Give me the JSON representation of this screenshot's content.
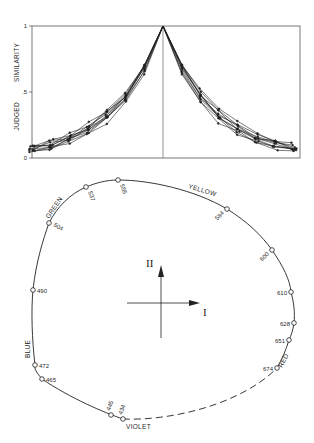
{
  "top_chart": {
    "ylabel_1": "JUDGED",
    "ylabel_2": "SIMILARITY",
    "ticks": [
      "1",
      ".5",
      "0"
    ]
  },
  "color_circle": {
    "axis_labels": {
      "I": "I",
      "II": "II"
    },
    "region_labels": [
      "GREEN",
      "YELLOW",
      "BLUE",
      "RED",
      "VIOLET"
    ],
    "points": [
      {
        "nm": "555",
        "x": 118,
        "y": 180
      },
      {
        "nm": "537",
        "x": 86,
        "y": 187
      },
      {
        "nm": "504",
        "x": 49,
        "y": 223
      },
      {
        "nm": "490",
        "x": 33,
        "y": 290
      },
      {
        "nm": "472",
        "x": 35,
        "y": 365
      },
      {
        "nm": "465",
        "x": 42,
        "y": 379
      },
      {
        "nm": "445",
        "x": 111,
        "y": 415
      },
      {
        "nm": "434",
        "x": 123,
        "y": 419
      },
      {
        "nm": "674",
        "x": 277,
        "y": 368
      },
      {
        "nm": "651",
        "x": 289,
        "y": 340
      },
      {
        "nm": "628",
        "x": 294,
        "y": 323
      },
      {
        "nm": "610",
        "x": 291,
        "y": 292
      },
      {
        "nm": "600",
        "x": 272,
        "y": 250
      },
      {
        "nm": "584",
        "x": 227,
        "y": 209
      }
    ]
  },
  "chart_data": [
    {
      "type": "line",
      "title": "",
      "xlabel": "",
      "ylabel": "JUDGED SIMILARITY",
      "ylim": [
        0,
        1
      ],
      "yticks": [
        "0",
        ".5",
        "1"
      ],
      "grid": false,
      "note": "Multiple overlapping generalization gradients peaking at 1 at the center and decaying roughly exponentially to ~0.05 at both edges",
      "x": [
        -6,
        -5,
        -4,
        -3,
        -2,
        -1,
        0,
        1,
        2,
        3,
        4,
        5,
        6
      ],
      "series": [
        {
          "name": "mean gradient",
          "values": [
            0.05,
            0.08,
            0.14,
            0.24,
            0.38,
            0.62,
            1.0,
            0.62,
            0.38,
            0.24,
            0.14,
            0.08,
            0.05
          ]
        }
      ]
    },
    {
      "type": "scatter",
      "title": "Color circle (Shepard)",
      "xlabel": "I",
      "ylabel": "II",
      "labels": [
        "555",
        "537",
        "504",
        "490",
        "472",
        "465",
        "445",
        "434",
        "674",
        "651",
        "628",
        "610",
        "600",
        "584"
      ],
      "regions": [
        "GREEN",
        "YELLOW",
        "BLUE",
        "RED",
        "VIOLET"
      ]
    }
  ]
}
